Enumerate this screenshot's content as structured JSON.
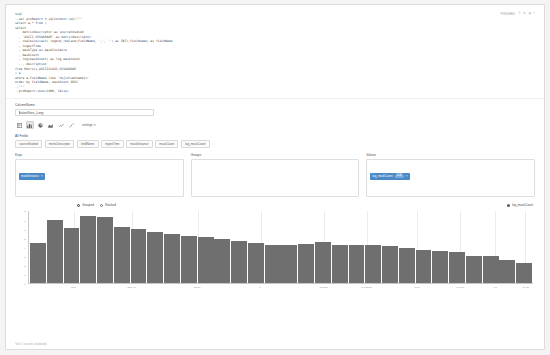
{
  "paragraph": {
    "status": "FINISHED",
    "controls": [
      "☰",
      "⚙",
      "▶",
      "»"
    ],
    "code_lines": [
      "%sql",
      "--val proReport = sqlContext.sql(\"\"\"",
      "select a.* from (",
      "select",
      "    metricDescriptor as sourceStudied",
      "  , 'ASCII_HISAGRADE' as metricDescriptor",
      "  , coalesce(cast( regexp_replace(fieldName, ',', '') as INT),fieldname) as fieldName",
      "  , ingestTime",
      "  , maskType as maskInstance",
      "  , maskCount",
      "  , log(maskCount) as log_maskCount",
      "  --, description",
      "from Metrics_ASCIICLASS_HISAGRADE",
      ") a",
      "where a.fieldName like '%${columnname}%'",
      "order by fieldName, maskCount DESC",
      "--\"\"\"",
      "--proReport.show(1000, false)"
    ]
  },
  "settings": {
    "column_name_label": "ColumnName",
    "column_name_value": "ActionSites_Long",
    "chart_types": [
      {
        "name": "table-chart-icon",
        "active": false
      },
      {
        "name": "bar-chart-icon",
        "active": true
      },
      {
        "name": "pie-chart-icon",
        "active": false
      },
      {
        "name": "area-chart-icon",
        "active": false
      },
      {
        "name": "line-chart-icon",
        "active": false
      },
      {
        "name": "scatter-chart-icon",
        "active": false
      }
    ],
    "settings_label": "settings ▾"
  },
  "all_fields": {
    "label": "All Fields",
    "fields": [
      "sourceStudied",
      "metricDescriptor",
      "fieldName",
      "ingestTime",
      "maskInstance",
      "maskCount",
      "log_maskCount"
    ]
  },
  "pivot": {
    "keys": {
      "label": "Keys",
      "items": [
        {
          "name": "maskInstance",
          "agg": "",
          "remove": "×"
        }
      ]
    },
    "groups": {
      "label": "Groups",
      "items": []
    },
    "values": {
      "label": "Values",
      "items": [
        {
          "name": "log_maskCount",
          "agg": "SUM",
          "remove": "×"
        }
      ]
    }
  },
  "chart_options": {
    "modes": [
      {
        "label": "Grouped",
        "selected": true
      },
      {
        "label": "Stacked",
        "selected": false
      }
    ],
    "legend": "log_maskCount"
  },
  "chart_data": {
    "type": "bar",
    "title": "",
    "xlabel": "",
    "ylabel": "",
    "ylim": [
      0,
      8
    ],
    "grid": true,
    "legend_position": "top-right",
    "yticks": [
      "8",
      "7",
      "6",
      "5",
      "4",
      "3",
      "2",
      "1",
      "0"
    ],
    "xticks": [
      {
        "label": "500",
        "pos": 9.0
      },
      {
        "label": "-800.449",
        "pos": 20.5
      },
      {
        "label": "50.00",
        "pos": 33.5
      },
      {
        "label": "0",
        "pos": 46.0
      },
      {
        "label": "-50.000",
        "pos": 58.5
      },
      {
        "label": "-0.000000",
        "pos": 67.0
      },
      {
        "label": "0.00",
        "pos": 77.0
      },
      {
        "label": "-999.00",
        "pos": 85.5
      },
      {
        "label": "0.0",
        "pos": 92.5
      },
      {
        "label": "-99.00",
        "pos": 98.5
      }
    ],
    "series": [
      {
        "name": "log_maskCount",
        "color": "#6f6f6f",
        "values": [
          4.55,
          7.0,
          6.15,
          7.55,
          7.4,
          6.25,
          6.1,
          5.75,
          5.55,
          5.25,
          5.15,
          4.9,
          4.7,
          4.55,
          4.3,
          4.25,
          4.35,
          4.6,
          4.25,
          4.3,
          4.25,
          4.15,
          3.95,
          3.75,
          3.65,
          3.55,
          3.1,
          3.1,
          2.6,
          2.25
        ]
      }
    ]
  },
  "footer": {
    "note": "Took 1 seconds (outdated)"
  }
}
